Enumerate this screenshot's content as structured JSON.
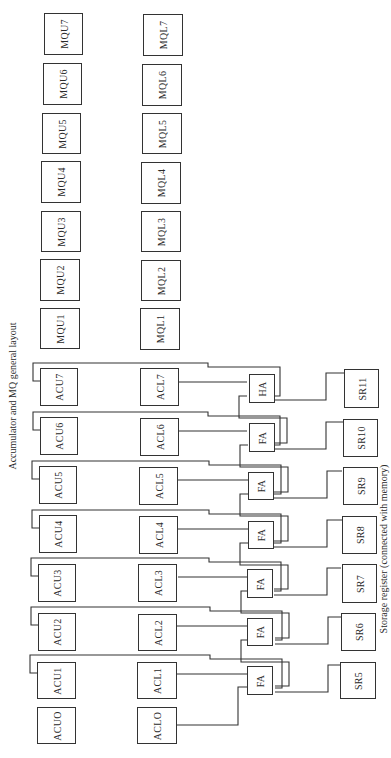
{
  "title": "Accumulator and MQ general layout",
  "caption": "Storage register (connected with memory)",
  "mq_upper": [
    "MQU1",
    "MQU2",
    "MQU3",
    "MQU4",
    "MQU5",
    "MQU6",
    "MQU7"
  ],
  "mq_lower": [
    "MQL1",
    "MQL2",
    "MQL3",
    "MQL4",
    "MQL5",
    "MQL6",
    "MQL7"
  ],
  "acc_upper": [
    "ACUO",
    "ACU1",
    "ACU2",
    "ACU3",
    "ACU4",
    "ACU5",
    "ACU6",
    "ACU7"
  ],
  "acc_lower": [
    "ACLO",
    "ACL1",
    "ACL2",
    "ACL3",
    "ACL4",
    "ACL5",
    "ACL6",
    "ACL7"
  ],
  "adders": [
    "FA",
    "FA",
    "FA",
    "FA",
    "FA",
    "FA",
    "HA"
  ],
  "storage": [
    "SR5",
    "SR6",
    "SR7",
    "SR8",
    "SR9",
    "SR10",
    "SR11"
  ]
}
